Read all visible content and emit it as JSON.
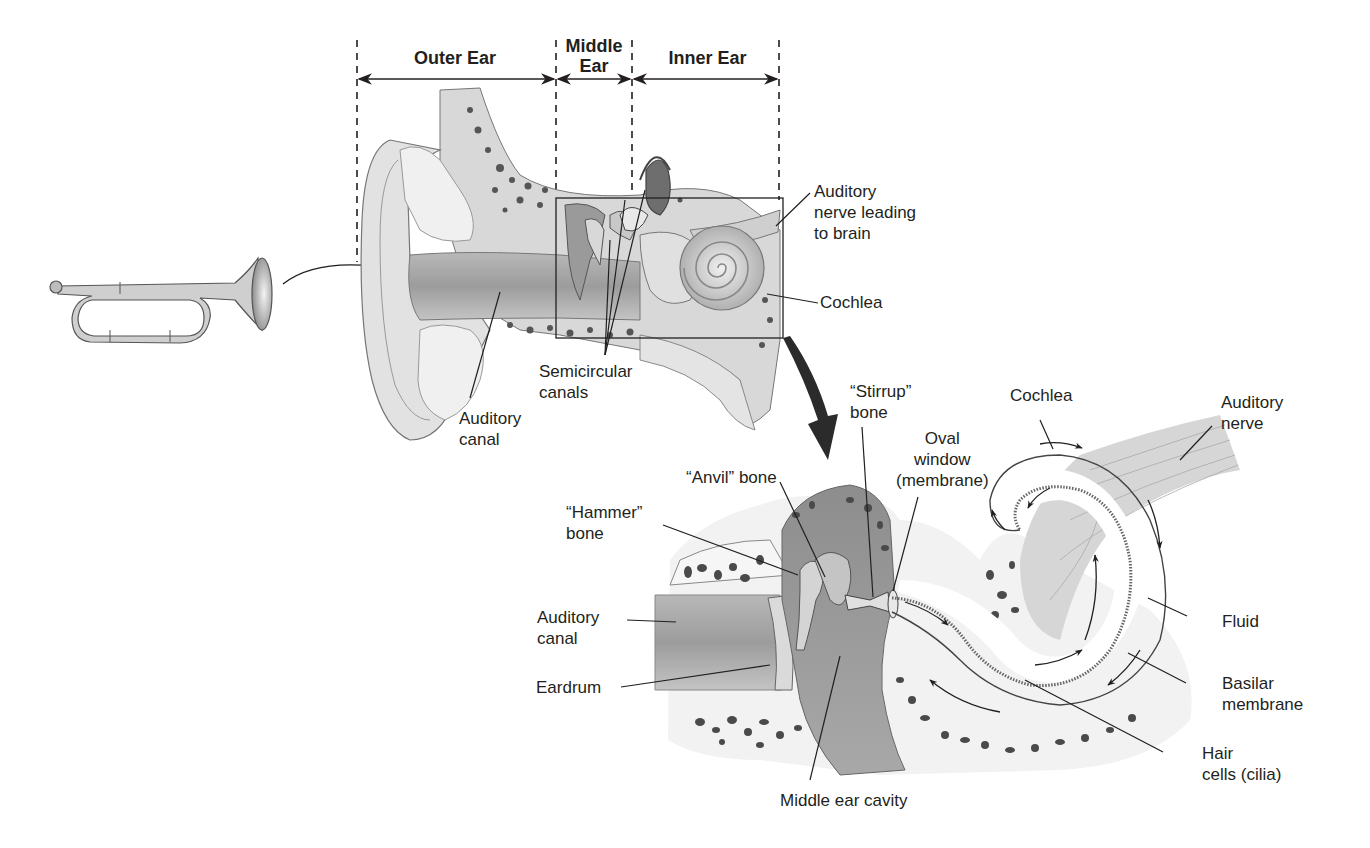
{
  "diagram": {
    "colors": {
      "line": "#231f20",
      "tissue_light": "#e6e6e6",
      "tissue_mid": "#bdbdbd",
      "tissue_dark": "#7a7a7a",
      "bone_spot": "#4a4a4a",
      "background": "#ffffff"
    },
    "region_headers": [
      {
        "id": "outer",
        "label": "Outer Ear"
      },
      {
        "id": "middle",
        "label": "Middle\nEar"
      },
      {
        "id": "inner",
        "label": "Inner Ear"
      }
    ],
    "icons": {
      "sound_source": "bugle-icon",
      "zoom_arrow": "curved-arrow-icon"
    },
    "top_labels": {
      "auditory_nerve_brain": "Auditory\nnerve leading\nto brain",
      "cochlea": "Cochlea",
      "semicircular_canals": "Semicircular\ncanals",
      "auditory_canal": "Auditory\ncanal"
    },
    "detail_labels": {
      "stirrup": "“Stirrup”\nbone",
      "cochlea": "Cochlea",
      "auditory_nerve": "Auditory\nnerve",
      "oval_window": "Oval\nwindow\n(membrane)",
      "anvil": "“Anvil” bone",
      "hammer": "“Hammer”\nbone",
      "auditory_canal": "Auditory\ncanal",
      "eardrum": "Eardrum",
      "fluid": "Fluid",
      "basilar_membrane": "Basilar\nmembrane",
      "hair_cells": "Hair\ncells (cilia)",
      "middle_ear_cavity": "Middle ear cavity"
    }
  }
}
